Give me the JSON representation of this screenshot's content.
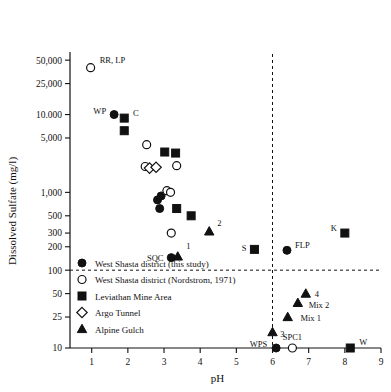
{
  "chart_data": {
    "type": "scatter",
    "title": "",
    "xlabel": "pH",
    "ylabel": "Dissolved Sulfate  (mg/l)",
    "xlim": [
      0.4,
      9
    ],
    "ylim": [
      10,
      60000
    ],
    "yscale": "log",
    "grid": false,
    "x_ticks": [
      "1",
      "2",
      "3",
      "4",
      "5",
      "6",
      "7",
      "8",
      "9"
    ],
    "x_tick_values": [
      1,
      2,
      3,
      4,
      5,
      6,
      7,
      8,
      9
    ],
    "y_ticks": [
      "50,000",
      "25,000",
      "10.000",
      "5,000",
      "1,000",
      "500",
      "300",
      "200",
      "100",
      "50",
      "25",
      "10"
    ],
    "y_tick_values": [
      50000,
      25000,
      10000,
      5000,
      1000,
      500,
      300,
      200,
      100,
      50,
      25,
      10
    ],
    "annotations": [
      {
        "text": "RR, LP",
        "x": 1.0,
        "y": 42000
      },
      {
        "text": "WP",
        "x": 1.62,
        "y": 10500
      },
      {
        "text": "C",
        "x": 1.92,
        "y": 9000
      },
      {
        "text": "2",
        "x": 4.28,
        "y": 320
      },
      {
        "text": "1",
        "x": 3.42,
        "y": 160
      },
      {
        "text": "SQC",
        "x": 3.18,
        "y": 145
      },
      {
        "text": "S",
        "x": 5.5,
        "y": 185
      },
      {
        "text": "FLP",
        "x": 6.4,
        "y": 180
      },
      {
        "text": "K",
        "x": 8.0,
        "y": 300
      },
      {
        "text": "4",
        "x": 6.95,
        "y": 50
      },
      {
        "text": "Mix 2",
        "x": 6.78,
        "y": 38
      },
      {
        "text": "Mix 1",
        "x": 6.55,
        "y": 25
      },
      {
        "text": "3",
        "x": 6.02,
        "y": 16
      },
      {
        "text": "WPS",
        "x": 6.1,
        "y": 10
      },
      {
        "text": "SPC1",
        "x": 6.55,
        "y": 10
      },
      {
        "text": "W",
        "x": 8.15,
        "y": 10
      }
    ],
    "reference_lines": [
      {
        "orientation": "horizontal",
        "value": 100,
        "style": "dashed"
      },
      {
        "orientation": "vertical",
        "value": 6.0,
        "style": "dashed"
      }
    ],
    "legend": {
      "position": "lower-left",
      "entries": [
        {
          "marker": "filled-circle",
          "label": "West Shasta district (this study)"
        },
        {
          "marker": "open-circle",
          "label": "West Shasta district (Nordstrom, 1971)"
        },
        {
          "marker": "filled-square",
          "label": "Leviathan Mine Area"
        },
        {
          "marker": "open-diamond",
          "label": "Argo Tunnel"
        },
        {
          "marker": "filled-triangle",
          "label": "Alpine Gulch"
        }
      ]
    },
    "series": [
      {
        "name": "West Shasta district (this study)",
        "marker": "filled-circle",
        "points": [
          {
            "x": 1.62,
            "y": 10000,
            "label": "WP"
          },
          {
            "x": 2.82,
            "y": 800
          },
          {
            "x": 2.92,
            "y": 900
          },
          {
            "x": 2.88,
            "y": 620
          },
          {
            "x": 3.2,
            "y": 145,
            "label": "SQC"
          },
          {
            "x": 6.4,
            "y": 180,
            "label": "FLP"
          },
          {
            "x": 6.1,
            "y": 10,
            "label": "WPS"
          }
        ]
      },
      {
        "name": "West Shasta district (Nordstrom, 1971)",
        "marker": "open-circle",
        "points": [
          {
            "x": 0.97,
            "y": 40000,
            "label": "RR, LP"
          },
          {
            "x": 2.52,
            "y": 4100
          },
          {
            "x": 2.48,
            "y": 2150
          },
          {
            "x": 3.35,
            "y": 2200
          },
          {
            "x": 3.08,
            "y": 1050
          },
          {
            "x": 3.18,
            "y": 1000
          },
          {
            "x": 3.2,
            "y": 300
          },
          {
            "x": 6.55,
            "y": 10,
            "label": "SPC1"
          }
        ]
      },
      {
        "name": "Leviathan Mine Area",
        "marker": "filled-square",
        "points": [
          {
            "x": 1.9,
            "y": 9000,
            "label": "C"
          },
          {
            "x": 1.9,
            "y": 6200
          },
          {
            "x": 3.02,
            "y": 3300
          },
          {
            "x": 3.32,
            "y": 3200
          },
          {
            "x": 3.35,
            "y": 620
          },
          {
            "x": 3.75,
            "y": 500
          },
          {
            "x": 5.5,
            "y": 185,
            "label": "S"
          },
          {
            "x": 8.0,
            "y": 300,
            "label": "K"
          },
          {
            "x": 8.15,
            "y": 10,
            "label": "W"
          }
        ]
      },
      {
        "name": "Argo Tunnel",
        "marker": "open-diamond",
        "points": [
          {
            "x": 2.6,
            "y": 2050
          },
          {
            "x": 2.78,
            "y": 2100
          }
        ]
      },
      {
        "name": "Alpine Gulch",
        "marker": "filled-triangle",
        "points": [
          {
            "x": 4.25,
            "y": 315,
            "label": "2"
          },
          {
            "x": 3.38,
            "y": 150,
            "label": "1"
          },
          {
            "x": 6.92,
            "y": 50,
            "label": "4"
          },
          {
            "x": 6.7,
            "y": 38,
            "label": "Mix 2"
          },
          {
            "x": 6.42,
            "y": 25,
            "label": "Mix 1"
          },
          {
            "x": 6.0,
            "y": 16,
            "label": "3"
          }
        ]
      }
    ]
  }
}
